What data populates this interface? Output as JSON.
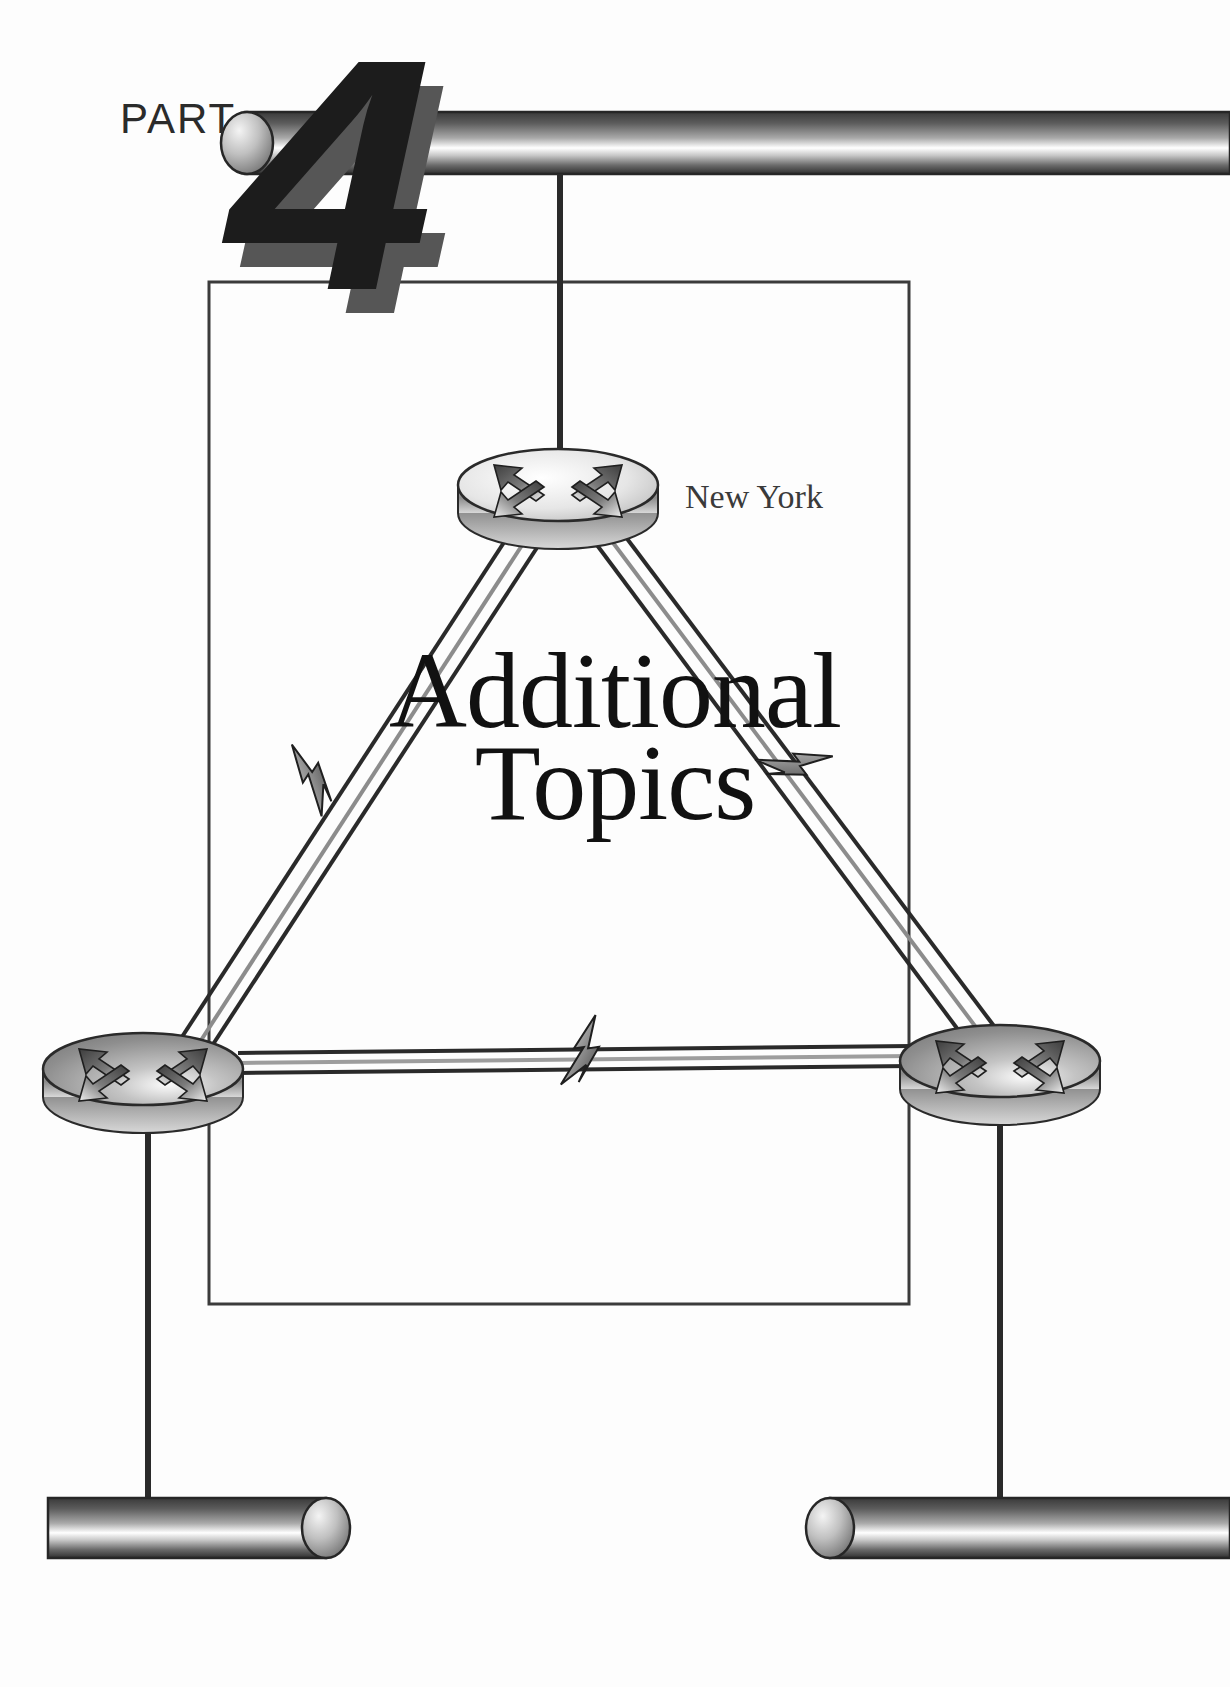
{
  "page": {
    "kind": "book-part-divider",
    "width": 1230,
    "height": 1687,
    "background_color": "#ffffff"
  },
  "part": {
    "word": "PART",
    "number": "4"
  },
  "title": {
    "line1": "Additional",
    "line2": "Topics"
  },
  "diagram": {
    "type": "network-topology",
    "frame_color": "#3b3b3b",
    "link_color": "#2a2a2a",
    "nodes": [
      {
        "id": "router-new-york",
        "icon": "router-icon",
        "label": "New York",
        "label_visible": true,
        "x": 558,
        "y": 485
      },
      {
        "id": "router-bottom-left",
        "icon": "router-icon",
        "label": "",
        "label_visible": false,
        "x": 143,
        "y": 1073
      },
      {
        "id": "router-bottom-right",
        "icon": "router-icon",
        "label": "",
        "label_visible": false,
        "x": 1000,
        "y": 1065
      }
    ],
    "segments": [
      {
        "id": "ethernet-top",
        "icon": "ethernet-bar-icon",
        "label": "",
        "cap": "left"
      },
      {
        "id": "ethernet-bottom-left",
        "icon": "ethernet-bar-icon",
        "label": "",
        "cap": "right"
      },
      {
        "id": "ethernet-bottom-right",
        "icon": "ethernet-bar-icon",
        "label": "",
        "cap": "left"
      }
    ],
    "links": [
      {
        "id": "link-ny-to-bottom-left",
        "from": "router-new-york",
        "to": "router-bottom-left",
        "marker": "lightning-bolt-icon"
      },
      {
        "id": "link-ny-to-bottom-right",
        "from": "router-new-york",
        "to": "router-bottom-right",
        "marker": "lightning-bolt-icon"
      },
      {
        "id": "link-bottom-left-to-bottom-right",
        "from": "router-bottom-left",
        "to": "router-bottom-right",
        "marker": "lightning-bolt-icon"
      },
      {
        "id": "drop-ny-to-ethernet-top",
        "from": "router-new-york",
        "to": "ethernet-top",
        "marker": "none"
      },
      {
        "id": "drop-bl-to-ethernet-bottom-left",
        "from": "router-bottom-left",
        "to": "ethernet-bottom-left",
        "marker": "none"
      },
      {
        "id": "drop-br-to-ethernet-bottom-right",
        "from": "router-bottom-right",
        "to": "ethernet-bottom-right",
        "marker": "none"
      }
    ]
  },
  "colors": {
    "ink": "#1c1c1c",
    "ink_soft": "#565656",
    "label": "#3a3a3a",
    "frame": "#3b3b3b",
    "pipe_dark": "#2f2f2f",
    "pipe_light": "#ffffff",
    "router_dark": "#6f6f6f",
    "router_light": "#f2f2f2"
  }
}
